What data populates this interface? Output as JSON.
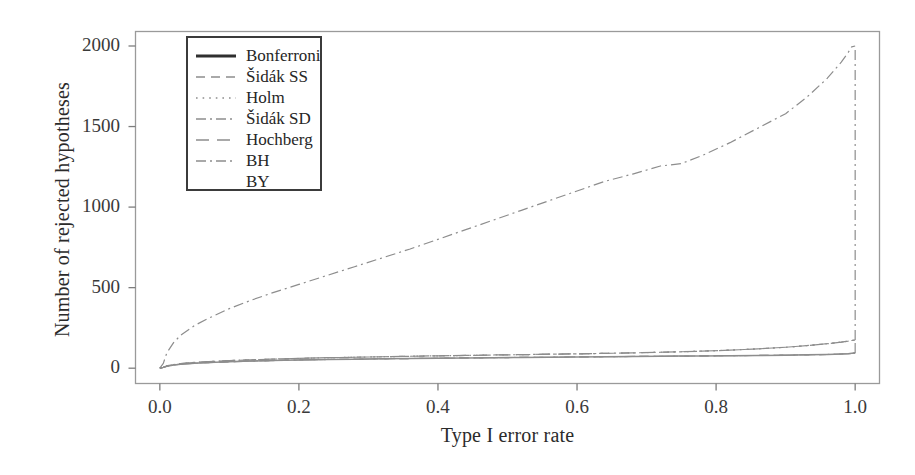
{
  "chart_data": {
    "type": "line",
    "title": "",
    "xlabel": "Type I error rate",
    "ylabel": "Number of rejected hypotheses",
    "xlim": [
      -0.035,
      1.035
    ],
    "ylim": [
      -95,
      2090
    ],
    "xticks": [
      "0.0",
      "0.2",
      "0.4",
      "0.6",
      "0.8",
      "1.0"
    ],
    "xtick_values": [
      0.0,
      0.2,
      0.4,
      0.6,
      0.8,
      1.0
    ],
    "yticks": [
      "0",
      "500",
      "1000",
      "1500",
      "2000"
    ],
    "ytick_values": [
      0,
      500,
      1000,
      1500,
      2000
    ],
    "grid": false,
    "legend_position": "upper left inside",
    "line_color": "#8d8d8d",
    "frame_color": "#9a9a9a",
    "x": [
      0.0,
      0.005,
      0.01,
      0.02,
      0.03,
      0.05,
      0.07,
      0.1,
      0.13,
      0.16,
      0.2,
      0.24,
      0.28,
      0.32,
      0.36,
      0.4,
      0.44,
      0.48,
      0.52,
      0.56,
      0.6,
      0.64,
      0.68,
      0.72,
      0.75,
      0.78,
      0.82,
      0.86,
      0.9,
      0.93,
      0.96,
      0.98,
      0.99,
      0.995,
      1.0
    ],
    "series": [
      {
        "name": "Bonferroni",
        "dash": "solid",
        "values": [
          0,
          5,
          12,
          20,
          25,
          31,
          35,
          40,
          44,
          47,
          51,
          54,
          56,
          58,
          60,
          62,
          64,
          65,
          67,
          68,
          70,
          71,
          73,
          74,
          75,
          76,
          78,
          79,
          81,
          83,
          85,
          88,
          90,
          92,
          95
        ]
      },
      {
        "name": "Šidák SS",
        "dash": "dashed",
        "values": [
          0,
          5,
          12,
          20,
          25,
          31,
          35,
          40,
          44,
          47,
          51,
          54,
          56,
          58,
          60,
          62,
          64,
          65,
          67,
          68,
          70,
          71,
          73,
          74,
          75,
          76,
          78,
          79,
          81,
          83,
          85,
          88,
          90,
          92,
          95
        ]
      },
      {
        "name": "Holm",
        "dash": "dotted",
        "values": [
          0,
          6,
          14,
          23,
          29,
          36,
          41,
          47,
          52,
          56,
          61,
          65,
          68,
          71,
          74,
          77,
          79,
          82,
          84,
          87,
          89,
          92,
          95,
          99,
          102,
          106,
          112,
          120,
          130,
          140,
          152,
          162,
          168,
          172,
          175
        ]
      },
      {
        "name": "Šidák SD",
        "dash": "dashdot",
        "values": [
          0,
          6,
          14,
          23,
          29,
          36,
          41,
          47,
          52,
          56,
          61,
          65,
          68,
          71,
          74,
          77,
          79,
          82,
          84,
          87,
          89,
          92,
          95,
          99,
          102,
          106,
          112,
          120,
          130,
          140,
          152,
          162,
          168,
          172,
          175
        ]
      },
      {
        "name": "Hochberg",
        "dash": "longdash",
        "values": [
          0,
          6,
          14,
          23,
          29,
          36,
          41,
          47,
          52,
          56,
          61,
          65,
          68,
          71,
          74,
          77,
          79,
          82,
          84,
          87,
          89,
          92,
          95,
          99,
          102,
          106,
          112,
          120,
          130,
          140,
          152,
          162,
          168,
          172,
          175
        ]
      },
      {
        "name": "BH",
        "dash": "dashdot",
        "values": [
          0,
          30,
          95,
          160,
          205,
          265,
          310,
          370,
          420,
          465,
          520,
          575,
          630,
          685,
          740,
          800,
          860,
          920,
          980,
          1040,
          1100,
          1160,
          1205,
          1255,
          1270,
          1320,
          1400,
          1490,
          1580,
          1680,
          1800,
          1900,
          1960,
          1995,
          2000
        ]
      },
      {
        "name": "BY",
        "dash": "dashdot",
        "values": [
          0,
          5,
          12,
          20,
          25,
          31,
          35,
          40,
          44,
          47,
          51,
          54,
          56,
          58,
          60,
          62,
          64,
          65,
          67,
          68,
          70,
          71,
          73,
          74,
          75,
          76,
          78,
          79,
          81,
          83,
          85,
          88,
          90,
          92,
          95
        ]
      }
    ],
    "legend_entries": [
      {
        "label": "Bonferroni",
        "dash": "solid"
      },
      {
        "label": "Šidák SS",
        "dash": "dashed"
      },
      {
        "label": "Holm",
        "dash": "dotted"
      },
      {
        "label": "Šidák SD",
        "dash": "dashdot"
      },
      {
        "label": "Hochberg",
        "dash": "longdash"
      },
      {
        "label": "BH",
        "dash": "dashdot"
      },
      {
        "label": "BY",
        "dash": "none"
      }
    ],
    "annotations": [
      "Near x = 1.0 the BH curve jumps vertically to 2000 (all hypotheses rejected).",
      "Near x = 1.0 the lower bundle jumps vertically from ~175 down/over to ~95."
    ]
  }
}
